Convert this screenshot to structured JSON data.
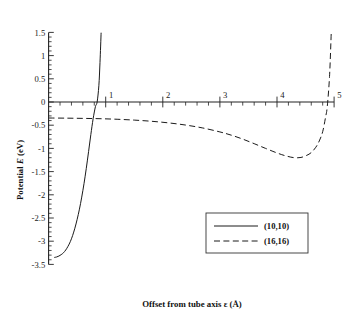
{
  "chart_data": {
    "type": "line",
    "title": "",
    "xlabel": "Offset from tube axis ε (Å)",
    "ylabel": "Potential E (eV)",
    "xlim": [
      0,
      5
    ],
    "ylim": [
      -3.5,
      1.5
    ],
    "grid": false,
    "legend_position": "center-right-lower",
    "x_ticks": [
      "1",
      "2",
      "3",
      "4",
      "5"
    ],
    "x_tick_values": [
      1,
      2,
      3,
      4,
      5
    ],
    "x_minor_tick_step": 0.2,
    "y_ticks": [
      "1.5",
      "1",
      "0.5",
      "0",
      "-0.5",
      "-1",
      "-1.5",
      "-2",
      "-2.5",
      "-3",
      "-3.5"
    ],
    "y_tick_values": [
      1.5,
      1,
      0.5,
      0,
      -0.5,
      -1,
      -1.5,
      -2,
      -2.5,
      -3,
      -3.5
    ],
    "y_minor_tick_step": 0.1,
    "series": [
      {
        "name": "(10,10)",
        "style": "solid",
        "color": "#1a1a1a",
        "x": [
          0.1,
          0.14,
          0.18,
          0.22,
          0.26,
          0.3,
          0.34,
          0.38,
          0.42,
          0.46,
          0.5,
          0.54,
          0.58,
          0.62,
          0.66,
          0.7,
          0.74,
          0.78,
          0.82,
          0.85,
          0.88,
          0.9,
          0.92
        ],
        "y": [
          -3.35,
          -3.34,
          -3.32,
          -3.29,
          -3.25,
          -3.19,
          -3.11,
          -3.01,
          -2.88,
          -2.72,
          -2.53,
          -2.31,
          -2.05,
          -1.76,
          -1.43,
          -1.07,
          -0.7,
          -0.36,
          -0.1,
          0.0,
          0.35,
          0.85,
          1.5
        ]
      },
      {
        "name": "(16,16)",
        "style": "dashed",
        "color": "#1a1a1a",
        "x": [
          0.0,
          0.3,
          0.6,
          0.9,
          1.2,
          1.5,
          1.8,
          2.1,
          2.4,
          2.7,
          3.0,
          3.2,
          3.4,
          3.6,
          3.8,
          4.0,
          4.15,
          4.3,
          4.42,
          4.52,
          4.6,
          4.68,
          4.74,
          4.8,
          4.85,
          4.88,
          4.92,
          4.95
        ],
        "y": [
          -0.345,
          -0.348,
          -0.353,
          -0.36,
          -0.372,
          -0.39,
          -0.415,
          -0.45,
          -0.497,
          -0.56,
          -0.645,
          -0.715,
          -0.8,
          -0.898,
          -1.0,
          -1.098,
          -1.16,
          -1.2,
          -1.195,
          -1.15,
          -1.09,
          -0.975,
          -0.84,
          -0.64,
          -0.33,
          -0.1,
          0.55,
          1.5
        ]
      }
    ]
  },
  "legend": {
    "entries": [
      {
        "label": "(10,10)",
        "style": "solid"
      },
      {
        "label": "(16,16)",
        "style": "dashed"
      }
    ]
  },
  "labels": {
    "y_axis_title_part1": "Potential ",
    "y_axis_title_italic": "E",
    "y_axis_title_part2": " (eV)",
    "x_axis_title": "Offset from tube axis ε (Å)"
  }
}
